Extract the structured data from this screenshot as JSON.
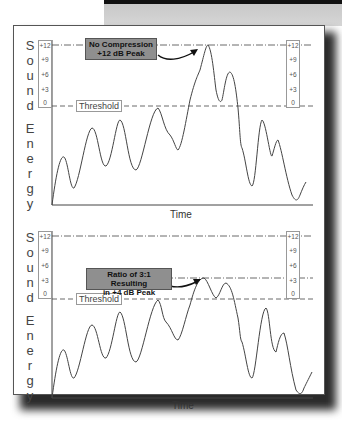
{
  "banner": {
    "colors": {
      "bar": "#111111",
      "band": "#cfcfcf"
    }
  },
  "panels": [
    {
      "id": "no-compression",
      "ylabel_letters": [
        "S",
        "o",
        "u",
        "n",
        "d",
        "",
        "E",
        "n",
        "e",
        "r",
        "g",
        "y"
      ],
      "scale_ticks": [
        "+12",
        "+9",
        "+6",
        "+3",
        "0"
      ],
      "threshold_label": "Threshold",
      "callout_lines": [
        "No Compression",
        "+12 dB Peak"
      ],
      "xlabel": "Time",
      "peak_db": 12
    },
    {
      "id": "compressed",
      "ylabel_letters": [
        "S",
        "o",
        "u",
        "n",
        "d",
        "",
        "E",
        "n",
        "e",
        "r",
        "g",
        "y"
      ],
      "scale_ticks": [
        "+12",
        "+9",
        "+6",
        "+3",
        "0"
      ],
      "threshold_label": "Threshold",
      "callout_lines": [
        "Ratio of 3:1 Resulting",
        "in +4 dB Peak"
      ],
      "xlabel": "Time",
      "peak_db": 4,
      "ratio": "3:1"
    }
  ],
  "colors": {
    "callout_fill": "#8f8f8f",
    "line": "#444444",
    "frame_shadow": "#2a2a2a"
  }
}
